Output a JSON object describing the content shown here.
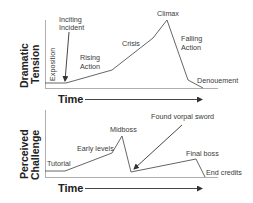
{
  "top_chart": {
    "y_label_line1": "Dramatic",
    "y_label_line2": "Tension",
    "x_label": "Time",
    "annotations": {
      "exposition": "Exposition",
      "inciting_line1": "Inciting",
      "inciting_line2": "Incident",
      "rising_line1": "Rising",
      "rising_line2": "Action",
      "crisis": "Crisis",
      "climax": "Climax",
      "falling_line1": "Falling",
      "falling_line2": "Action",
      "denouement": "Denouement"
    }
  },
  "bottom_chart": {
    "y_label_line1": "Perceived",
    "y_label_line2": "Challenge",
    "x_label": "Time",
    "annotations": {
      "tutorial": "Tutorial",
      "early_levels": "Early levels",
      "midboss": "Midboss",
      "vorpal": "Found vorpal sword",
      "final_boss": "Final boss",
      "end_credits": "End credits"
    }
  },
  "colors": {
    "line": "#555555",
    "axis": "#9a9a9a",
    "text": "#3a3a3a"
  }
}
